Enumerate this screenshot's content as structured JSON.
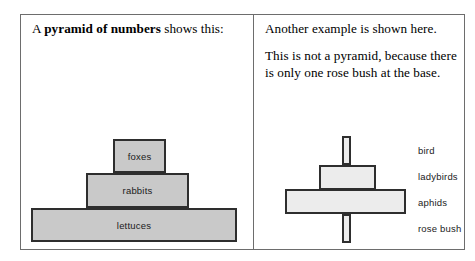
{
  "left_panel": {
    "caption_prefix": "A ",
    "caption_bold": "pyramid of numbers",
    "caption_suffix": " shows this:",
    "pyramid": {
      "type": "pyramid-of-numbers",
      "levels": [
        {
          "label": "foxes",
          "tier": "top",
          "relative_width": "small"
        },
        {
          "label": "rabbits",
          "tier": "middle",
          "relative_width": "medium"
        },
        {
          "label": "lettuces",
          "tier": "base",
          "relative_width": "large"
        }
      ],
      "fill_color": "#c9c9c9",
      "border_color": "#2e2e2e"
    }
  },
  "right_panel": {
    "paragraph_1": "Another example is shown here.",
    "paragraph_2": "This is not a pyramid, because there is only one rose bush at the base.",
    "diagram": {
      "type": "inverted-pyramid",
      "levels": [
        {
          "label": "bird",
          "tier": "top",
          "relative_width": "very-narrow"
        },
        {
          "label": "ladybirds",
          "tier": "second",
          "relative_width": "medium"
        },
        {
          "label": "aphids",
          "tier": "third",
          "relative_width": "large"
        },
        {
          "label": "rose bush",
          "tier": "base",
          "relative_width": "very-narrow"
        }
      ],
      "fill_color": "#ececec",
      "border_color": "#2e2e2e"
    }
  },
  "frame": {
    "border_color": "#6d6d6d",
    "background": "#ffffff"
  }
}
